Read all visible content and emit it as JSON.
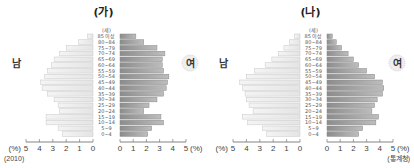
{
  "chart_data": [
    {
      "type": "bar",
      "orientation": "horizontal-population-pyramid",
      "title": "(가)",
      "age_unit_label": "(세)",
      "categories": [
        "0~4",
        "5~9",
        "10~14",
        "15~19",
        "20~24",
        "25~29",
        "30~34",
        "35~39",
        "40~44",
        "45~49",
        "50~54",
        "55~59",
        "60~64",
        "65~69",
        "70~74",
        "75~79",
        "80~84",
        "85 이상"
      ],
      "series": [
        {
          "name": "남",
          "side": "left",
          "values": [
            2.3,
            2.6,
            3.5,
            3.5,
            2.5,
            2.6,
            2.9,
            3.4,
            3.8,
            3.9,
            3.6,
            3.4,
            3.1,
            2.9,
            2.5,
            2.0,
            1.1,
            0.4
          ]
        },
        {
          "name": "여",
          "side": "right",
          "values": [
            2.1,
            2.4,
            3.3,
            3.1,
            1.8,
            2.2,
            2.8,
            3.3,
            3.5,
            3.6,
            3.7,
            3.3,
            3.2,
            3.2,
            3.4,
            2.8,
            1.8,
            1.2
          ]
        }
      ],
      "xlabel_left": "(%)",
      "xlabel_right": "(%)",
      "xticks_left": [
        "5",
        "4",
        "3",
        "2",
        "1",
        "0"
      ],
      "xticks_right": [
        "0",
        "1",
        "2",
        "3",
        "4",
        "5"
      ],
      "xlim": [
        0,
        5
      ],
      "note": "(2010)",
      "colors": {
        "male": "#e4e4e4",
        "female": "#9a9a9a"
      }
    },
    {
      "type": "bar",
      "orientation": "horizontal-population-pyramid",
      "title": "(나)",
      "age_unit_label": "(세)",
      "categories": [
        "0~4",
        "5~9",
        "10~14",
        "15~19",
        "20~24",
        "25~29",
        "30~34",
        "35~39",
        "40~44",
        "45~49",
        "50~54",
        "55~59",
        "60~64",
        "65~69",
        "70~74",
        "75~79",
        "80~84",
        "85 이상"
      ],
      "series": [
        {
          "name": "남",
          "side": "left",
          "values": [
            2.5,
            2.8,
            3.9,
            4.3,
            3.5,
            3.8,
            4.0,
            4.1,
            4.3,
            4.5,
            4.0,
            3.4,
            2.6,
            2.1,
            1.6,
            1.2,
            0.8,
            0.4
          ]
        },
        {
          "name": "여",
          "side": "right",
          "values": [
            2.4,
            2.7,
            3.7,
            3.9,
            3.4,
            3.6,
            3.8,
            4.2,
            4.3,
            4.2,
            3.6,
            3.0,
            2.4,
            2.0,
            1.6,
            1.1,
            0.7,
            0.4
          ]
        }
      ],
      "xlabel_left": "(%)",
      "xlabel_right": "(%)",
      "xticks_left": [
        "5",
        "4",
        "3",
        "2",
        "1",
        "0"
      ],
      "xticks_right": [
        "0",
        "1",
        "2",
        "3",
        "4",
        "5"
      ],
      "xlim": [
        0,
        5
      ],
      "note": "(통계청)",
      "colors": {
        "male": "#e4e4e4",
        "female": "#9a9a9a"
      }
    }
  ]
}
